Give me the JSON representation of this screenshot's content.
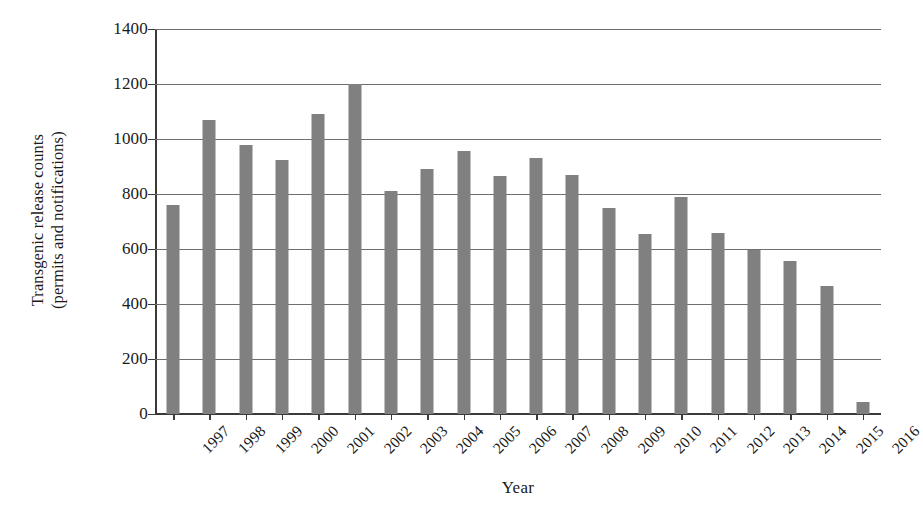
{
  "chart_data": {
    "type": "bar",
    "title": "",
    "xlabel": "Year",
    "ylabel": "Transgenic release counts (permits and notifications)",
    "ylabel_lines": [
      "Transgenic release counts",
      "(permits and notifications)"
    ],
    "categories": [
      "1997",
      "1998",
      "1999",
      "2000",
      "2001",
      "2002",
      "2003",
      "2004",
      "2005",
      "2006",
      "2007",
      "2008",
      "2009",
      "2010",
      "2011",
      "2012",
      "2013",
      "2014",
      "2015",
      "2016"
    ],
    "values": [
      760,
      1070,
      980,
      925,
      1090,
      1200,
      810,
      890,
      955,
      865,
      930,
      870,
      750,
      655,
      790,
      660,
      595,
      555,
      465,
      45
    ],
    "ylim": [
      0,
      1400
    ],
    "yticks": [
      1400,
      1200,
      1000,
      800,
      600,
      400,
      200,
      0
    ],
    "ytick_labels": [
      "1400",
      "1200",
      "1000",
      "800",
      "600",
      "400",
      "200",
      "0"
    ],
    "grid": "horizontal",
    "legend": "none",
    "bar_color": "#808080",
    "axis_color": "#3a3a3a",
    "grid_color": "#6e6e6e",
    "background": "#ffffff"
  }
}
